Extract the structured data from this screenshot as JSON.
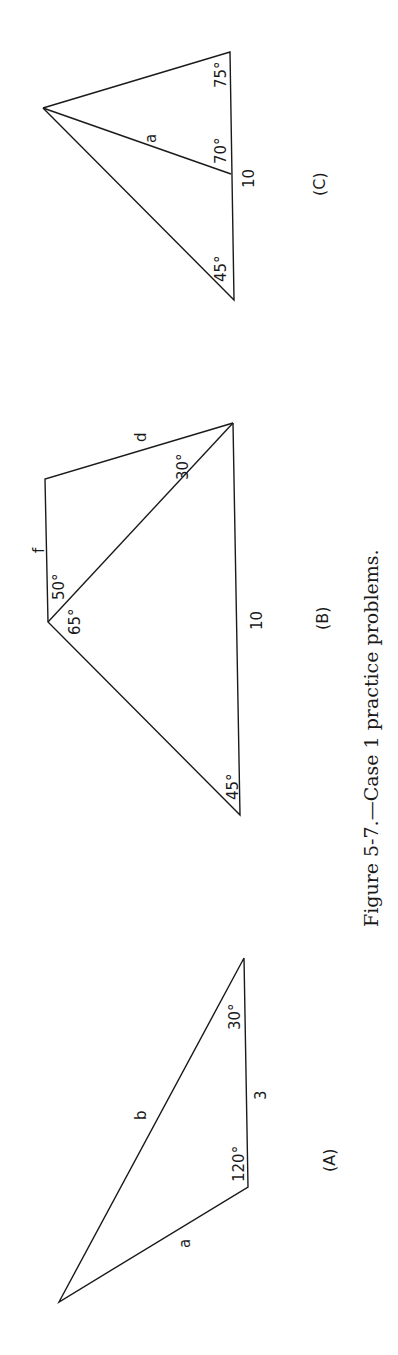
{
  "figure": {
    "caption": "Figure 5-7.—Case 1 practice problems.",
    "orientation": "rotated 90deg counter-clockwise"
  },
  "panels": [
    {
      "id": "A",
      "label": "(A)",
      "angles": [
        "120°",
        "30°"
      ],
      "sides": [
        "a",
        "b",
        "3"
      ]
    },
    {
      "id": "B",
      "label": "(B)",
      "angles": [
        "45°",
        "65°",
        "50°",
        "30°"
      ],
      "sides": [
        "f",
        "d",
        "10"
      ]
    },
    {
      "id": "C",
      "label": "(C)",
      "angles": [
        "45°",
        "70°",
        "75°"
      ],
      "sides": [
        "a",
        "10"
      ]
    }
  ]
}
